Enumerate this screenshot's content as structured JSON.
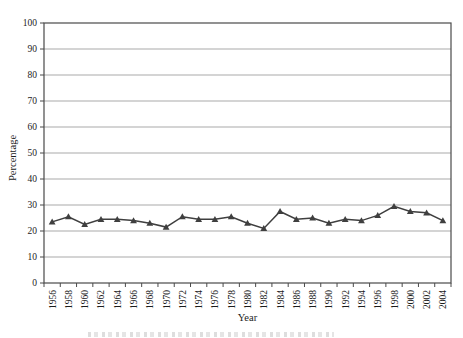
{
  "chart_data": {
    "type": "line",
    "title": "",
    "xlabel": "Year",
    "ylabel": "Percentage",
    "ylim": [
      0,
      100
    ],
    "yticks": [
      0,
      10,
      20,
      30,
      40,
      50,
      60,
      70,
      80,
      90,
      100
    ],
    "grid": "horizontal",
    "legend": "none",
    "marker": "triangle",
    "categories": [
      "1956",
      "1958",
      "1960",
      "1962",
      "1964",
      "1966",
      "1968",
      "1970",
      "1972",
      "1974",
      "1976",
      "1978",
      "1980",
      "1982",
      "1984",
      "1986",
      "1988",
      "1990",
      "1992",
      "1994",
      "1996",
      "1998",
      "2000",
      "2002",
      "2004"
    ],
    "series": [
      {
        "name": "Percentage",
        "values": [
          23.5,
          25.5,
          22.5,
          24.5,
          24.5,
          24,
          23,
          21.5,
          25.5,
          24.5,
          24.5,
          25.5,
          23,
          21,
          27.5,
          24.5,
          25,
          23,
          24.5,
          24,
          26,
          29.5,
          27.5,
          27,
          24
        ]
      }
    ],
    "colors": {
      "line": "#3f3f3f",
      "grid": "#a9a9a9",
      "axis": "#4a4a4a",
      "text": "#1c1c1c",
      "background": "#ffffff"
    }
  }
}
